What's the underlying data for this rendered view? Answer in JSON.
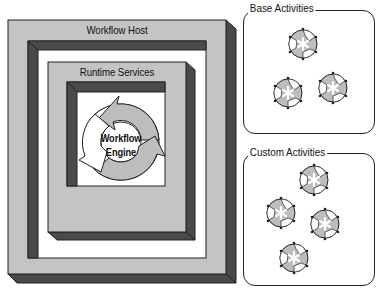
{
  "diagram": {
    "type": "architecture-nesting",
    "host": {
      "label": "Workflow Host",
      "contains": {
        "label": "Runtime Services",
        "contains": {
          "label_line1": "Workflow",
          "label_line2": "Engine"
        }
      }
    },
    "panels": [
      {
        "title": "Base Activities",
        "activity_count": 3
      },
      {
        "title": "Custom Activities",
        "activity_count": 4
      }
    ],
    "colors": {
      "face": "#c4c4c4",
      "side": "#4a4a4a",
      "outline": "#222222",
      "well": "#ffffff",
      "arrow": "#bdbdbd"
    }
  }
}
